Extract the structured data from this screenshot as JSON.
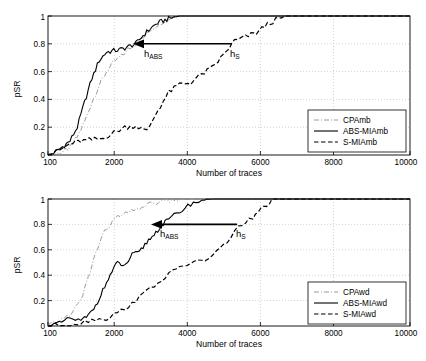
{
  "page": {
    "width": 426,
    "height": 361
  },
  "colors": {
    "axis": "#000000",
    "grid": "#b4b4b4",
    "cpa": "#9a9a9a",
    "abs": "#000000",
    "smia": "#000000",
    "background": "#ffffff"
  },
  "chart_data": [
    {
      "id": "chart-amb",
      "type": "line",
      "title": "",
      "xlabel": "Number of traces",
      "ylabel": "pSR",
      "xlim": [
        100,
        10000
      ],
      "ylim": [
        0,
        1
      ],
      "xticks": [
        100,
        2000,
        4000,
        6000,
        8000,
        10000
      ],
      "xticklabels": [
        "100",
        "2000",
        "4000",
        "6000",
        "8000",
        "10000"
      ],
      "yticks": [
        0,
        0.2,
        0.4,
        0.6,
        0.8,
        1
      ],
      "yticklabels": [
        "0",
        "0.2",
        "0.4",
        "0.6",
        "0.8",
        "1"
      ],
      "grid": true,
      "legend_position": "lower right",
      "legend": [
        "CPAmb",
        "ABS-MIAmb",
        "S-MIAmb"
      ],
      "annotations": [
        {
          "label": "h_ABS",
          "text_main": "h",
          "text_sub": "ABS",
          "x": 2800,
          "y": 0.74
        },
        {
          "label": "h_S",
          "text_main": "h",
          "text_sub": "S",
          "x": 5100,
          "y": 0.74
        },
        {
          "label": "arrow",
          "from_x": 5000,
          "from_y": 0.8,
          "to_x": 2720,
          "to_y": 0.8
        }
      ],
      "series": [
        {
          "name": "CPAmb",
          "style": "dash-dot",
          "x": [
            100,
            300,
            500,
            700,
            900,
            1100,
            1300,
            1500,
            1700,
            1900,
            2100,
            2300,
            2500,
            2700,
            2900,
            3100,
            3300,
            3500,
            3700,
            3900,
            4200,
            10000
          ],
          "values": [
            0.0,
            0.01,
            0.02,
            0.05,
            0.13,
            0.24,
            0.38,
            0.5,
            0.6,
            0.67,
            0.71,
            0.76,
            0.8,
            0.84,
            0.9,
            0.94,
            0.97,
            0.99,
            1.0,
            1.0,
            1.0,
            1.0
          ]
        },
        {
          "name": "ABS-MIAmb",
          "style": "solid",
          "x": [
            100,
            300,
            500,
            700,
            900,
            1100,
            1300,
            1500,
            1700,
            1900,
            2100,
            2300,
            2500,
            2700,
            2900,
            3100,
            3300,
            3500,
            3700,
            3900,
            4200,
            10000
          ],
          "values": [
            0.0,
            0.02,
            0.06,
            0.1,
            0.2,
            0.38,
            0.55,
            0.68,
            0.74,
            0.75,
            0.76,
            0.78,
            0.8,
            0.86,
            0.91,
            0.95,
            0.97,
            0.99,
            1.0,
            1.0,
            1.0,
            1.0
          ]
        },
        {
          "name": "S-MIAmb",
          "style": "dashed",
          "x": [
            100,
            400,
            700,
            1000,
            1300,
            1600,
            1900,
            2200,
            2500,
            2800,
            3100,
            3400,
            3700,
            4000,
            4300,
            4600,
            4900,
            5200,
            5500,
            5800,
            6100,
            6400,
            6700,
            7000,
            10000
          ],
          "values": [
            0.0,
            0.03,
            0.08,
            0.1,
            0.11,
            0.12,
            0.16,
            0.2,
            0.21,
            0.17,
            0.32,
            0.45,
            0.51,
            0.52,
            0.58,
            0.63,
            0.72,
            0.82,
            0.85,
            0.88,
            0.94,
            0.98,
            1.0,
            1.0,
            1.0
          ]
        }
      ]
    },
    {
      "id": "chart-awd",
      "type": "line",
      "title": "",
      "xlabel": "Number of traces",
      "ylabel": "pSR",
      "xlim": [
        100,
        10000
      ],
      "ylim": [
        0,
        1
      ],
      "xticks": [
        100,
        2000,
        4000,
        6000,
        8000,
        10000
      ],
      "xticklabels": [
        "100",
        "2000",
        "4000",
        "6000",
        "8000",
        "10000"
      ],
      "yticks": [
        0,
        0.2,
        0.4,
        0.6,
        0.8,
        1
      ],
      "yticklabels": [
        "0",
        "0.2",
        "0.4",
        "0.6",
        "0.8",
        "1"
      ],
      "grid": true,
      "legend_position": "lower right",
      "legend": [
        "CPAwd",
        "ABS-MIAwd",
        "S-MIAwd"
      ],
      "annotations": [
        {
          "label": "h_ABS",
          "text_main": "h",
          "text_sub": "ABS",
          "x": 3200,
          "y": 0.73
        },
        {
          "label": "h_S",
          "text_main": "h",
          "text_sub": "S",
          "x": 5350,
          "y": 0.73
        },
        {
          "label": "arrow",
          "from_x": 5250,
          "from_y": 0.8,
          "to_x": 3120,
          "to_y": 0.8
        }
      ],
      "series": [
        {
          "name": "CPAwd",
          "style": "dash-dot",
          "x": [
            100,
            400,
            700,
            1000,
            1200,
            1400,
            1600,
            1800,
            2000,
            2300,
            2600,
            2900,
            3200,
            3500,
            3800,
            4100,
            10000
          ],
          "values": [
            0.0,
            0.04,
            0.09,
            0.2,
            0.38,
            0.57,
            0.72,
            0.8,
            0.86,
            0.89,
            0.93,
            0.96,
            0.98,
            0.99,
            1.0,
            1.0,
            1.0
          ]
        },
        {
          "name": "ABS-MIAwd",
          "style": "solid",
          "x": [
            100,
            400,
            700,
            1000,
            1200,
            1400,
            1600,
            1800,
            2000,
            2200,
            2400,
            2600,
            2800,
            3000,
            3200,
            3400,
            3700,
            4000,
            4300,
            4600,
            10000
          ],
          "values": [
            0.0,
            0.02,
            0.06,
            0.04,
            0.08,
            0.16,
            0.28,
            0.4,
            0.5,
            0.47,
            0.56,
            0.58,
            0.66,
            0.72,
            0.79,
            0.84,
            0.9,
            0.96,
            0.99,
            1.0,
            1.0
          ]
        },
        {
          "name": "S-MIAwd",
          "style": "dashed",
          "x": [
            100,
            500,
            900,
            1300,
            1700,
            2100,
            2500,
            2900,
            3300,
            3700,
            4100,
            4500,
            4900,
            5300,
            5700,
            6000,
            6300,
            10000
          ],
          "values": [
            0.0,
            0.01,
            0.02,
            0.05,
            0.06,
            0.12,
            0.2,
            0.3,
            0.38,
            0.47,
            0.5,
            0.53,
            0.63,
            0.78,
            0.85,
            0.94,
            1.0,
            1.0
          ]
        }
      ]
    }
  ]
}
